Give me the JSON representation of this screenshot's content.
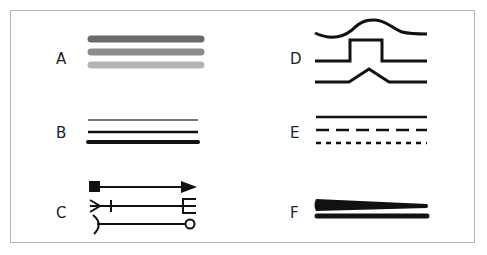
{
  "figure": {
    "panels": [
      {
        "label": "A",
        "description": "three thick lines in decreasing gray shades",
        "colors": [
          "#6b6b6b",
          "#8c8c8c",
          "#b4b4b4"
        ]
      },
      {
        "label": "B",
        "description": "three lines of increasing thickness",
        "colors": [
          "#444444",
          "#111111",
          "#111111"
        ]
      },
      {
        "label": "C",
        "description": "lines with different end markers: square-to-arrow, feather/tick-to-fork, hook-to-circle"
      },
      {
        "label": "D",
        "description": "lines with bump shapes: smooth curve, rectangular step, triangular peak"
      },
      {
        "label": "E",
        "description": "line styles: solid, dashed, dotted"
      },
      {
        "label": "F",
        "description": "tapered line and uniform thick line"
      }
    ]
  }
}
